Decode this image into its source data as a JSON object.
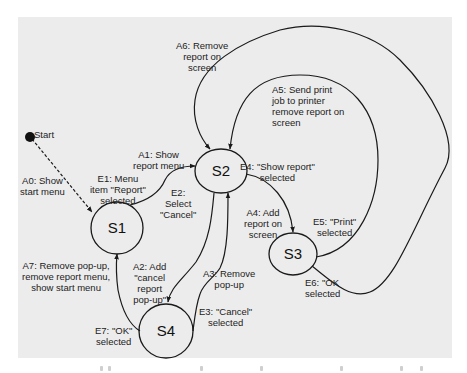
{
  "diagram": {
    "type": "state-transition",
    "start_label": "Start",
    "states": [
      {
        "id": "S1",
        "label": "S1",
        "cx": 117,
        "cy": 228,
        "rx": 26,
        "ry": 26
      },
      {
        "id": "S2",
        "label": "S2",
        "cx": 221,
        "cy": 171,
        "rx": 26,
        "ry": 22
      },
      {
        "id": "S3",
        "label": "S3",
        "cx": 293,
        "cy": 254,
        "rx": 24,
        "ry": 21
      },
      {
        "id": "S4",
        "label": "S4",
        "cx": 166,
        "cy": 331,
        "rx": 27,
        "ry": 27
      }
    ],
    "labels": {
      "a0": "A0: Show\nstart menu",
      "a1": "A1: Show\nreport menu",
      "e1": "E1: Menu\nitem \"Report\"\nselected",
      "e2": "E2:\nSelect\n\"Cancel\"",
      "a6": "A6: Remove\nreport on\nscreen",
      "a5": "A5: Send print\njob to printer\nremove report on\nscreen",
      "e4": "E4: \"Show report\"\nselected",
      "a4": "A4: Add\nreport on\nscreen",
      "e5": "E5: \"Print\"\nselected",
      "e6": "E6: \"OK\nselected",
      "a7": "A7: Remove pop-up,\nremove report menu,\nshow start menu",
      "a2": "A2: Add\n\"cancel\nreport\npop-up\"",
      "a3": "A3: Remove\npop-up",
      "e3": "E3: \"Cancel\"\nselected",
      "e7": "E7: \"OK\"\nselected"
    },
    "transitions": [
      {
        "from": "Start",
        "to": "S1",
        "event": "",
        "action": "A0: Show start menu",
        "style": "dashed"
      },
      {
        "from": "S1",
        "to": "S2",
        "event": "E1: Menu item \"Report\" selected",
        "action": "A1: Show report menu"
      },
      {
        "from": "S2",
        "to": "S4",
        "event": "E2: Select \"Cancel\"",
        "action": "A2: Add \"cancel report pop-up\""
      },
      {
        "from": "S4",
        "to": "S2",
        "event": "E3: \"Cancel\" selected",
        "action": "A3: Remove pop-up"
      },
      {
        "from": "S2",
        "to": "S3",
        "event": "E4: \"Show report\" selected",
        "action": "A4: Add report on screen"
      },
      {
        "from": "S3",
        "to": "S2",
        "event": "E5: \"Print\" selected",
        "action": "A5: Send print job to printer remove report on screen"
      },
      {
        "from": "S3",
        "to": "S2",
        "event": "E6: \"OK selected",
        "action": "A6: Remove report on screen"
      },
      {
        "from": "S4",
        "to": "S1",
        "event": "E7: \"OK\" selected",
        "action": "A7: Remove pop-up, remove report menu, show start menu"
      }
    ],
    "colors": {
      "panel": "#ececec",
      "line": "#1a1a1a",
      "text": "#222222"
    }
  }
}
